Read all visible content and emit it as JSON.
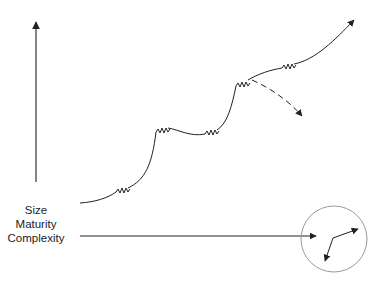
{
  "diagram": {
    "axis_label_lines": [
      "Size",
      "Maturity",
      "Complexity"
    ],
    "colors": {
      "stroke": "#222222",
      "circle": "#999999",
      "background": "#ffffff"
    },
    "elements": {
      "vertical_axis": "upward arrow",
      "horizontal_axis": "rightward arrow into circle",
      "growth_curve": "s-curve path with spring/zigzag segments ending in arrow to upper right",
      "dashed_branch": "dashed arrow branching downward from upper plateau",
      "circle_inset": "circle containing a bent two-headed arrow"
    }
  }
}
